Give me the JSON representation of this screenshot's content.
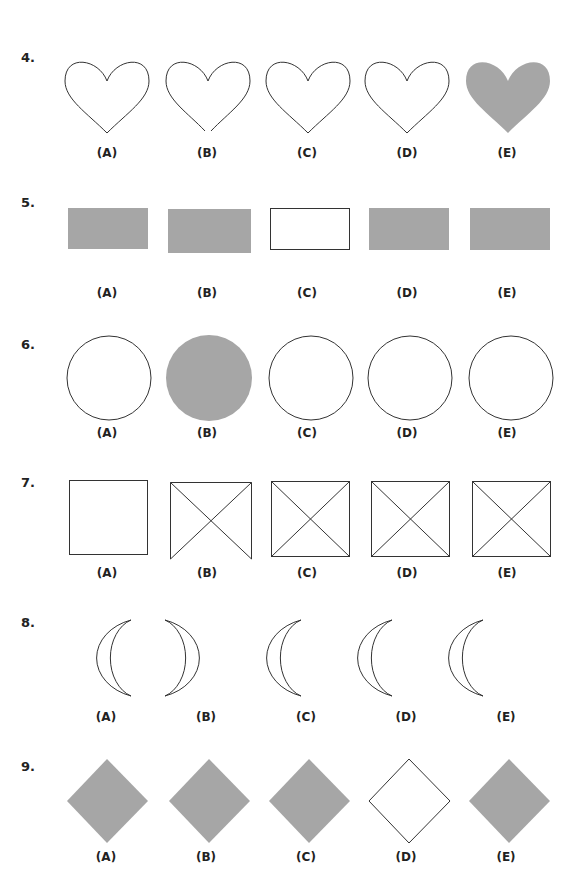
{
  "questions": [
    {
      "number": "4.",
      "shape": "heart",
      "options": [
        "(A)",
        "(B)",
        "(C)",
        "(D)",
        "(E)"
      ],
      "odd_one": "E",
      "note": "E filled gray; B has gap at bottom point"
    },
    {
      "number": "5.",
      "shape": "rectangle",
      "options": [
        "(A)",
        "(B)",
        "(C)",
        "(D)",
        "(E)"
      ],
      "odd_one": "C",
      "note": "C is outlined; others filled gray"
    },
    {
      "number": "6.",
      "shape": "circle",
      "options": [
        "(A)",
        "(B)",
        "(C)",
        "(D)",
        "(E)"
      ],
      "odd_one": "B",
      "note": "B filled gray"
    },
    {
      "number": "7.",
      "shape": "square-with-diagonals",
      "options": [
        "(A)",
        "(B)",
        "(C)",
        "(D)",
        "(E)"
      ],
      "odd_one": "A",
      "note": "A has no diagonals; B missing bottom edge"
    },
    {
      "number": "8.",
      "shape": "crescent",
      "options": [
        "(A)",
        "(B)",
        "(C)",
        "(D)",
        "(E)"
      ],
      "odd_one": "B",
      "note": "B faces opposite direction"
    },
    {
      "number": "9.",
      "shape": "diamond",
      "options": [
        "(A)",
        "(B)",
        "(C)",
        "(D)",
        "(E)"
      ],
      "odd_one": "D",
      "note": "D is outlined; others filled gray"
    }
  ],
  "colors": {
    "fill": "#a6a6a6",
    "stroke": "#333333"
  }
}
